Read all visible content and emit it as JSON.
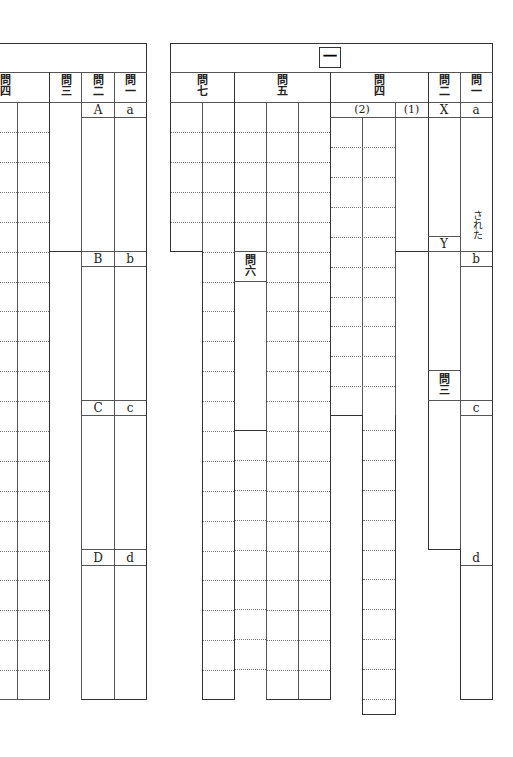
{
  "section_number": "一",
  "left_sheet": {
    "headers": [
      {
        "id": "q4",
        "label": "問\n四"
      },
      {
        "id": "q3",
        "label": "問\n三"
      },
      {
        "id": "q2",
        "label": "問\n二"
      },
      {
        "id": "q1",
        "label": "問\n一"
      }
    ],
    "q2_labels": [
      "A",
      "B",
      "C",
      "D"
    ],
    "q1_labels": [
      "a",
      "b",
      "c",
      "d"
    ]
  },
  "right_sheet": {
    "headers": [
      {
        "id": "q7",
        "label": "問\n七"
      },
      {
        "id": "q5",
        "label": "問\n五"
      },
      {
        "id": "q4",
        "label": "問\n四"
      },
      {
        "id": "q2",
        "label": "問\n二"
      },
      {
        "id": "q1",
        "label": "問\n一"
      }
    ],
    "q4_sub": [
      "(2)",
      "(1)"
    ],
    "q2_labels": [
      "X",
      "Y"
    ],
    "q3_label": "問\n三",
    "q6_label": "問\n六",
    "q1_labels": [
      "a",
      "b",
      "c",
      "d"
    ],
    "q1_suffix": "された"
  }
}
